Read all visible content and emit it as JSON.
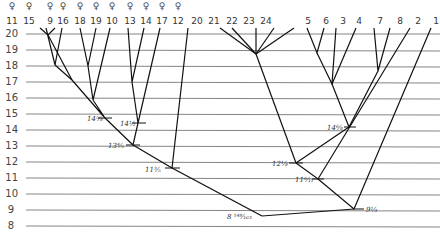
{
  "diagram": {
    "type": "dendrogram",
    "y_axis": {
      "ticks": [
        "20",
        "19",
        "18",
        "17",
        "16",
        "15",
        "14",
        "13",
        "12",
        "11",
        "10",
        "9",
        "8"
      ]
    },
    "leaves": [
      {
        "label": "11",
        "symbol": "♀"
      },
      {
        "label": "15",
        "symbol": "♀"
      },
      {
        "label": "9",
        "symbol": "♀"
      },
      {
        "label": "16",
        "symbol": "♀"
      },
      {
        "label": "18",
        "symbol": "♀"
      },
      {
        "label": "19",
        "symbol": "♀"
      },
      {
        "label": "10",
        "symbol": "♀"
      },
      {
        "label": "13",
        "symbol": "♀"
      },
      {
        "label": "14",
        "symbol": "♀"
      },
      {
        "label": "17",
        "symbol": "♀"
      },
      {
        "label": "12",
        "symbol": "♀"
      },
      {
        "label": "20",
        "symbol": ""
      },
      {
        "label": "21",
        "symbol": ""
      },
      {
        "label": "22",
        "symbol": ""
      },
      {
        "label": "23",
        "symbol": ""
      },
      {
        "label": "24",
        "symbol": ""
      },
      {
        "label": "5",
        "symbol": ""
      },
      {
        "label": "6",
        "symbol": ""
      },
      {
        "label": "3",
        "symbol": ""
      },
      {
        "label": "4",
        "symbol": ""
      },
      {
        "label": "7",
        "symbol": ""
      },
      {
        "label": "8",
        "symbol": ""
      },
      {
        "label": "2",
        "symbol": ""
      },
      {
        "label": "1",
        "symbol": ""
      }
    ],
    "node_labels": [
      {
        "id": "n14a",
        "text": "14⅝"
      },
      {
        "id": "n14b",
        "text": "14½"
      },
      {
        "id": "n13",
        "text": "13⅘"
      },
      {
        "id": "n11a",
        "text": "11⅗"
      },
      {
        "id": "n8",
        "text": "8 ¹⁴⁸⁄₁₆₃"
      },
      {
        "id": "n14c",
        "text": "14⁶⁄₈"
      },
      {
        "id": "n12",
        "text": "12⅛"
      },
      {
        "id": "n11b",
        "text": "11⁶⁄₁₁"
      },
      {
        "id": "n9",
        "text": "9⅓"
      }
    ]
  }
}
